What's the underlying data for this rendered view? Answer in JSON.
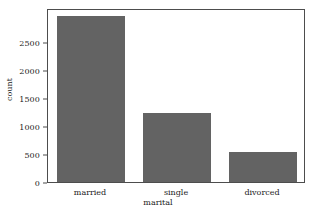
{
  "chart_data": {
    "type": "bar",
    "title": "",
    "categories": [
      "married",
      "single",
      "divorced"
    ],
    "values": [
      2960,
      1230,
      535
    ],
    "xlabel": "marital",
    "ylabel": "count",
    "ylim": [
      0,
      3100
    ],
    "yticks": [
      0,
      500,
      1000,
      1500,
      2000,
      2500
    ],
    "ytick_labels": [
      "0",
      "500",
      "1000",
      "1500",
      "2000",
      "2500"
    ],
    "grid": false,
    "legend": null,
    "bar_color": "#636363",
    "axes_color": "#4d4d4d",
    "background": "#ffffff"
  }
}
